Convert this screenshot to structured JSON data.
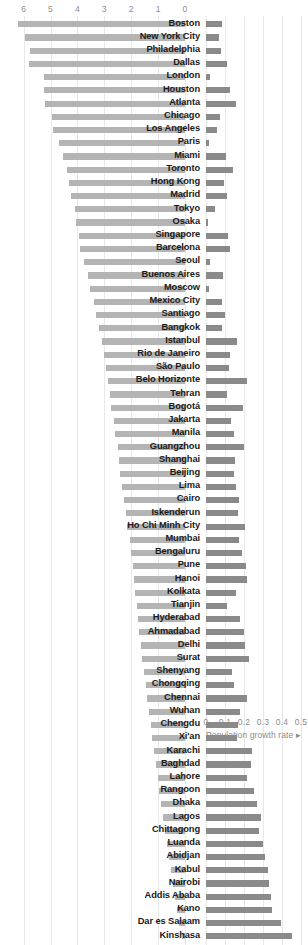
{
  "chart_data": {
    "type": "bar",
    "subtype": "diverging-butterfly",
    "title": "",
    "subtitle": "",
    "left_axis": {
      "label": "",
      "ticks": [
        6,
        5,
        4,
        3,
        2,
        1,
        0
      ],
      "tick_labels": [
        "6",
        "5",
        "4",
        "3",
        "2",
        "1",
        "0"
      ],
      "range": [
        6,
        0
      ],
      "direction": "descending-left-to-right",
      "position": "top"
    },
    "right_axis": {
      "label": "Population growth rate",
      "label_suffix": "▸",
      "ticks": [
        0,
        0.1,
        0.2,
        0.3,
        0.4,
        0.5
      ],
      "tick_labels": [
        "0",
        "0.1",
        "0.2",
        "0.3",
        "0.4",
        "0.5"
      ],
      "range": [
        0,
        0.5
      ],
      "direction": "ascending",
      "position": "bottom"
    },
    "grid": true,
    "legend": false,
    "colors": {
      "bar_left": "#b4b4b4",
      "bar_right": "#8a8a8a",
      "label_text": "#1a1a1a",
      "axis_text": "#8c8c8c",
      "gridline": "#e8e8e8",
      "background": "#ffffff"
    },
    "categories": [
      "Boston",
      "New York City",
      "Philadelphia",
      "Dallas",
      "London",
      "Houston",
      "Atlanta",
      "Chicago",
      "Los Angeles",
      "Paris",
      "Miami",
      "Toronto",
      "Hong Kong",
      "Madrid",
      "Tokyo",
      "Osaka",
      "Singapore",
      "Barcelona",
      "Seoul",
      "Buenos Aires",
      "Moscow",
      "Mexico City",
      "Santiago",
      "Bangkok",
      "Istanbul",
      "Rio de Janeiro",
      "São Paulo",
      "Belo Horizonte",
      "Tehran",
      "Bogotá",
      "Jakarta",
      "Manila",
      "Guangzhou",
      "Shanghai",
      "Beijing",
      "Lima",
      "Cairo",
      "Iskenderun",
      "Ho Chi Minh City",
      "Mumbai",
      "Bengaluru",
      "Pune",
      "Hanoi",
      "Kolkata",
      "Tianjin",
      "Hyderabad",
      "Ahmadabad",
      "Delhi",
      "Surat",
      "Shenyang",
      "Chongqing",
      "Chennai",
      "Wuhan",
      "Chengdu",
      "Xi'an",
      "Karachi",
      "Baghdad",
      "Lahore",
      "Rangoon",
      "Dhaka",
      "Lagos",
      "Chittagong",
      "Luanda",
      "Abidjan",
      "Kabul",
      "Nairobi",
      "Addis Ababa",
      "Kano",
      "Dar es Salaam",
      "Kinshasa"
    ],
    "series": [
      {
        "name": "GDP per capita index",
        "axis": "left",
        "direction": "left",
        "values": [
          6.2,
          5.95,
          5.75,
          5.8,
          5.25,
          5.25,
          5.2,
          4.95,
          4.9,
          4.7,
          4.55,
          4.4,
          4.3,
          4.25,
          4.1,
          4.05,
          3.95,
          3.9,
          3.75,
          3.6,
          3.55,
          3.4,
          3.3,
          3.2,
          3.1,
          3.0,
          2.95,
          2.85,
          2.8,
          2.75,
          2.65,
          2.6,
          2.5,
          2.45,
          2.4,
          2.35,
          2.25,
          2.2,
          2.15,
          2.05,
          2.0,
          1.95,
          1.9,
          1.85,
          1.8,
          1.75,
          1.7,
          1.65,
          1.58,
          1.52,
          1.46,
          1.4,
          1.34,
          1.28,
          1.22,
          1.15,
          1.08,
          1.02,
          0.96,
          0.9,
          0.82,
          0.75,
          0.68,
          0.6,
          0.52,
          0.45,
          0.38,
          0.3,
          0.22,
          0.12
        ]
      },
      {
        "name": "Population growth rate",
        "axis": "right",
        "direction": "right",
        "values": [
          0.085,
          0.07,
          0.08,
          0.11,
          0.022,
          0.125,
          0.16,
          0.072,
          0.06,
          0.015,
          0.105,
          0.14,
          0.095,
          0.112,
          0.048,
          0.01,
          0.118,
          0.128,
          0.02,
          0.09,
          0.014,
          0.085,
          0.098,
          0.082,
          0.165,
          0.128,
          0.122,
          0.215,
          0.11,
          0.195,
          0.132,
          0.145,
          0.2,
          0.155,
          0.148,
          0.16,
          0.172,
          0.168,
          0.205,
          0.175,
          0.192,
          0.21,
          0.215,
          0.158,
          0.108,
          0.18,
          0.2,
          0.205,
          0.225,
          0.135,
          0.145,
          0.215,
          0.18,
          0.17,
          0.165,
          0.24,
          0.235,
          0.218,
          0.255,
          0.268,
          0.29,
          0.28,
          0.3,
          0.31,
          0.325,
          0.33,
          0.34,
          0.348,
          0.395,
          0.45
        ]
      }
    ]
  },
  "layout": {
    "left_axis_x0": 185,
    "left_axis_px_per_unit": 26.9,
    "right_axis_x0": 206,
    "right_axis_px_per_unit": 190,
    "label_right_edge": 200,
    "row_height": 13.22,
    "rows_top": 18
  }
}
